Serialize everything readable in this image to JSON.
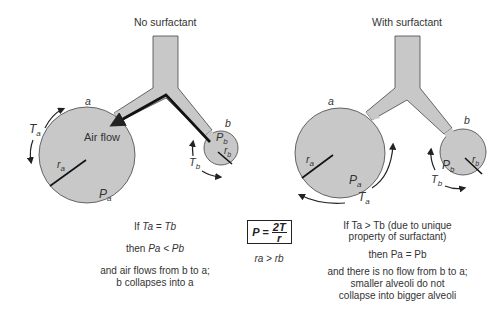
{
  "left_panel": {
    "title": "No surfactant",
    "alveolus_a": {
      "label": "a",
      "tension": "T",
      "tension_sub": "a",
      "radius": "r",
      "radius_sub": "a",
      "pressure": "P",
      "pressure_sub": "a"
    },
    "alveolus_b": {
      "label": "b",
      "tension": "T",
      "tension_sub": "b",
      "radius": "r",
      "radius_sub": "b",
      "pressure": "P",
      "pressure_sub": "b"
    },
    "airflow_label": "Air flow",
    "caption": {
      "line1_prefix": "If ",
      "line1_expr": "Ta = Tb",
      "line2_prefix": "then ",
      "line2_expr": "Pa < Pb",
      "line3": "and air flows from b to a;",
      "line4": "b collapses into a"
    }
  },
  "center": {
    "formula_lhs": "P = ",
    "formula_num": "2T",
    "formula_den": "r",
    "relation": "ra > rb"
  },
  "right_panel": {
    "title": "With surfactant",
    "alveolus_a": {
      "label": "a",
      "tension": "T",
      "tension_sub": "a",
      "radius": "r",
      "radius_sub": "a",
      "pressure": "P",
      "pressure_sub": "a"
    },
    "alveolus_b": {
      "label": "b",
      "tension": "T",
      "tension_sub": "b",
      "radius": "r",
      "radius_sub": "b",
      "pressure": "P",
      "pressure_sub": "b"
    },
    "caption": {
      "line1": "If Ta > Tb (due to unique",
      "line2": "property of surfactant)",
      "line3": "then Pa = Pb",
      "line4": "and there is no flow from b to a;",
      "line5": "smaller alveoli do not",
      "line6": "collapse into bigger alveoli"
    }
  },
  "colors": {
    "fill": "#c8c8c8",
    "stroke": "#333333",
    "text": "#333333"
  }
}
